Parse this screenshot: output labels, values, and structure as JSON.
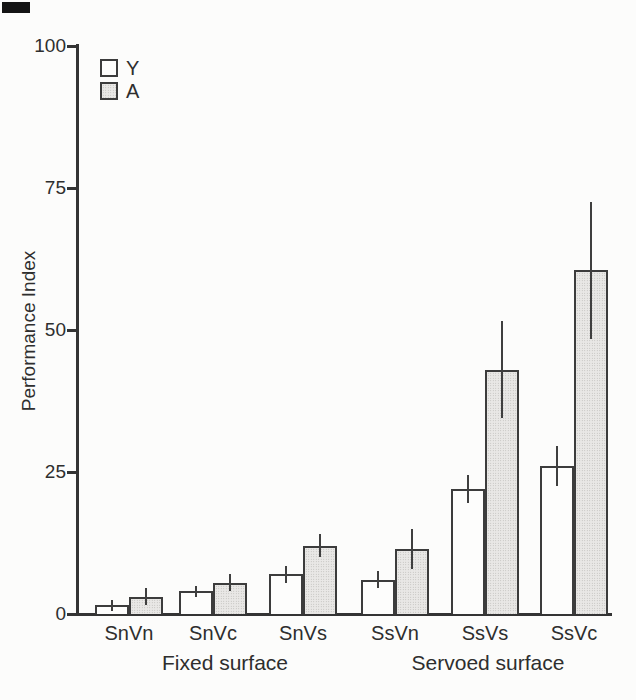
{
  "chart_data": {
    "type": "bar",
    "title": "",
    "xlabel": "",
    "ylabel": "Performance Index",
    "ylim": [
      0,
      100
    ],
    "yticks": [
      "0",
      "25",
      "50",
      "75",
      "100"
    ],
    "ytick_values": [
      0,
      25,
      50,
      75,
      100
    ],
    "grid": false,
    "legend_position": "top-left",
    "bar_style": "grouped pairs with error bars, white vs stippled gray fill, dark outlines",
    "categories": [
      "SnVn",
      "SnVc",
      "SnVs",
      "SsVn",
      "SsVs",
      "SsVc"
    ],
    "group_labels": [
      {
        "label": "Fixed surface",
        "categories": [
          "SnVn",
          "SnVc",
          "SnVs"
        ]
      },
      {
        "label": "Servoed surface",
        "categories": [
          "SsVn",
          "SsVs",
          "SsVc"
        ]
      }
    ],
    "series": [
      {
        "name": "Y",
        "fill": "#fdfdfc",
        "values": [
          1.5,
          4,
          7,
          6,
          22,
          26
        ],
        "errors": [
          1,
          1,
          1.5,
          1.5,
          2.5,
          3.5
        ]
      },
      {
        "name": "A",
        "fill": "#e0dfdd",
        "values": [
          3,
          5.5,
          12,
          11.5,
          43,
          60.5
        ],
        "errors": [
          1.5,
          1.5,
          2,
          3.5,
          8.5,
          12
        ]
      }
    ],
    "colors": {
      "axis": "#343434",
      "bar_outline": "#3c3c3c",
      "stipple_fill": "#e0dfdd",
      "white_fill": "#fdfdfc",
      "text": "#2e2e2e",
      "background": "#fcfcfb"
    }
  }
}
